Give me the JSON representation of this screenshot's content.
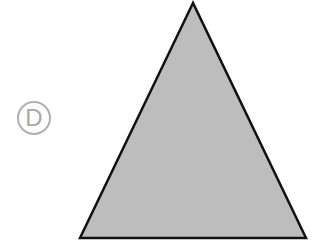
{
  "option_label": "D",
  "shape": {
    "type": "triangle",
    "fill": "#bdbdbd",
    "stroke": "#111111",
    "points": "193,3 80,238 306,238"
  }
}
